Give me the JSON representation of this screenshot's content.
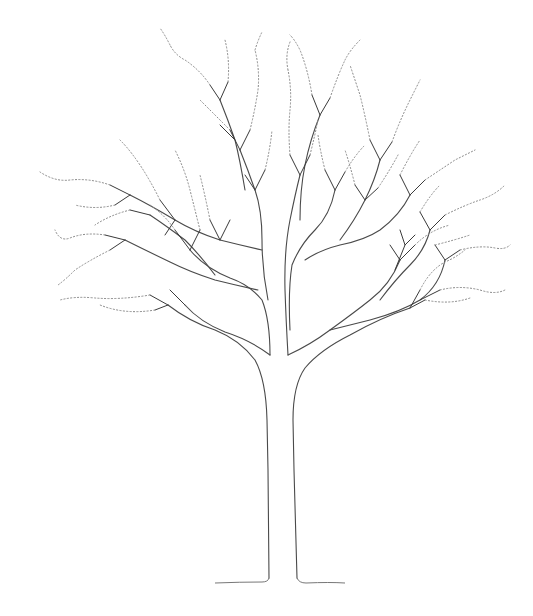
{
  "image": {
    "subject": "Pen-and-ink line drawing of a deciduous tree without leaves",
    "caption": "Line drawing of a bare tree",
    "colors": {
      "background": "#ffffff",
      "ink": "#4a4a4a",
      "fine_twigs": "#8a8a8a"
    }
  }
}
